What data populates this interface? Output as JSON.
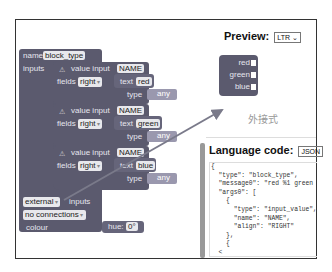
{
  "workspace": {
    "root_block": {
      "name_label": "name",
      "name_value": "block_type",
      "inputs_label": "inputs",
      "inputs_mode": "external",
      "inputs_suffix": "inputs",
      "connections": "no connections",
      "colour_label": "colour",
      "hue_label": "hue:",
      "hue_value": "0°"
    },
    "inputs": [
      {
        "kind": "value input",
        "name": "NAME",
        "fields_label": "fields",
        "align": "right",
        "text_label": "text",
        "text_value": "red",
        "type_label": "type",
        "type_value": "any"
      },
      {
        "kind": "value input",
        "name": "NAME",
        "fields_label": "fields",
        "align": "right",
        "text_label": "text",
        "text_value": "green",
        "type_label": "type",
        "type_value": "any"
      },
      {
        "kind": "value input",
        "name": "NAME",
        "fields_label": "fields",
        "align": "right",
        "text_label": "text",
        "text_value": "blue",
        "type_label": "type",
        "type_value": "any"
      }
    ],
    "warning_icon": "⚠"
  },
  "preview": {
    "title": "Preview:",
    "direction": "LTR",
    "block_labels": [
      "red",
      "green",
      "blue"
    ],
    "caption": "外接式",
    "block_color": "#5b5a6e"
  },
  "language": {
    "title": "Language code:",
    "format": "JSON",
    "code_lines": [
      "{",
      "  \"type\": \"block_type\",",
      "  \"message0\": \"red %1 green",
      "  \"args0\": [",
      "    {",
      "      \"type\": \"input_value\",",
      "      \"name\": \"NAME\",",
      "      \"align\": \"RIGHT\"",
      "    },",
      "    {",
      "  <"
    ]
  },
  "colors": {
    "block": "#5b5a6e",
    "type_block": "#9a98ae",
    "arrow": "#7a7a8a"
  }
}
